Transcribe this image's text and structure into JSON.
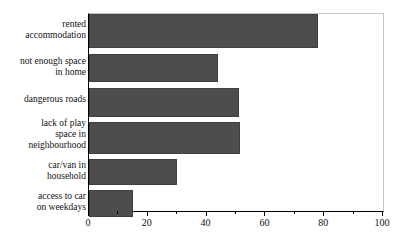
{
  "chart_data": {
    "type": "bar",
    "orientation": "horizontal",
    "title": "",
    "subtitle": "",
    "xlabel": "",
    "ylabel": "",
    "xlim": [
      0,
      100
    ],
    "xticks": [
      0,
      20,
      40,
      60,
      80,
      100
    ],
    "xtick_labels": [
      "0",
      "20",
      "40",
      "60",
      "80",
      "100"
    ],
    "xminorticks": [
      10,
      30,
      50,
      70,
      90
    ],
    "grid": false,
    "legend": null,
    "bar_color": "#4d4d4d",
    "frame_color": "#c8c8c8",
    "axis_color": "#000000",
    "categories": [
      "rented\naccommodation",
      "not enough space\nin home",
      "dangerous roads",
      "lack of play\nspace in\nneighbourhood",
      "car/van in\nhousehold",
      "access to car\non weekdays"
    ],
    "values": [
      78,
      44,
      51,
      51.5,
      30,
      15
    ]
  }
}
